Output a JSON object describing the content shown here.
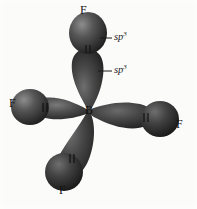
{
  "figure": {
    "background_color": "#fbfbfa",
    "lobe_dark_color": "#2b2b2b",
    "lobe_mid_color": "#4a4a4a",
    "lobe_highlight_color": "#8f8f8f",
    "label_color": "#141414"
  },
  "center_atom": {
    "symbol": "B",
    "x": 88,
    "y": 110
  },
  "ligands": [
    {
      "symbol": "F",
      "position": "top",
      "x": 84,
      "y": 10
    },
    {
      "symbol": "F",
      "position": "left",
      "x": 12,
      "y": 103
    },
    {
      "symbol": "F",
      "position": "right",
      "x": 177,
      "y": 124
    },
    {
      "symbol": "F",
      "position": "bottom-left",
      "x": 61,
      "y": 190
    }
  ],
  "annotations": [
    {
      "base": "sp",
      "exponent": "3",
      "target": "top-fluorine-orbital",
      "x": 114,
      "y": 33,
      "leader_from_x": 100,
      "leader_from_y": 38,
      "leader_to_x": 112,
      "leader_to_y": 38
    },
    {
      "base": "sp",
      "exponent": "3",
      "target": "boron-sp3-hybrid-orbital",
      "x": 114,
      "y": 66,
      "leader_from_x": 98,
      "leader_from_y": 71,
      "leader_to_x": 112,
      "leader_to_y": 71
    }
  ],
  "orbital_lobes": [
    {
      "name": "boron-lobe-up",
      "angle": -90,
      "length": 66,
      "width": 34
    },
    {
      "name": "boron-lobe-left",
      "angle": 186,
      "length": 62,
      "width": 30
    },
    {
      "name": "boron-lobe-right",
      "angle": 12,
      "length": 64,
      "width": 30
    },
    {
      "name": "boron-lobe-down-left",
      "angle": 104,
      "length": 64,
      "width": 32
    }
  ],
  "fluorine_orbitals": [
    {
      "name": "fluorine-orbital-top",
      "cx": 88,
      "cy": 33,
      "rx": 19,
      "ry": 21
    },
    {
      "name": "fluorine-orbital-left",
      "cx": 30,
      "cy": 107,
      "rx": 19,
      "ry": 18
    },
    {
      "name": "fluorine-orbital-right",
      "cx": 160,
      "cy": 119,
      "rx": 19,
      "ry": 18
    },
    {
      "name": "fluorine-orbital-bottom-left",
      "cx": 64,
      "cy": 172,
      "rx": 19,
      "ry": 19
    }
  ],
  "overlap_marks": [
    {
      "name": "overlap-mark-top",
      "x": 88,
      "y": 49
    },
    {
      "name": "overlap-mark-left",
      "x": 45,
      "y": 107
    },
    {
      "name": "overlap-mark-right",
      "x": 146,
      "y": 117
    },
    {
      "name": "overlap-mark-bottom-left",
      "x": 72,
      "y": 158
    }
  ]
}
